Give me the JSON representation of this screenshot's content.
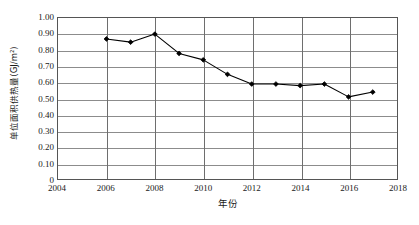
{
  "chart_data": {
    "type": "line",
    "title": "",
    "xlabel": "年份",
    "ylabel": "单位面积供热量(GJ/m²)",
    "xlim": [
      2004,
      2018
    ],
    "ylim": [
      0,
      1.0
    ],
    "grid": true,
    "legend": false,
    "x_ticks": [
      "2004",
      "2006",
      "2008",
      "2010",
      "2012",
      "2014",
      "2016",
      "2018"
    ],
    "x_tick_values": [
      2004,
      2006,
      2008,
      2010,
      2012,
      2014,
      2016,
      2018
    ],
    "y_ticks": [
      "0",
      "0.10",
      "0.20",
      "0.30",
      "0.40",
      "0.50",
      "0.60",
      "0.70",
      "0.80",
      "0.90",
      "1.00"
    ],
    "y_tick_values": [
      0,
      0.1,
      0.2,
      0.3,
      0.4,
      0.5,
      0.6,
      0.7,
      0.8,
      0.9,
      1.0
    ],
    "marker": "filled-diamond",
    "line_color": "#000000",
    "marker_color": "#000000",
    "x": [
      2006,
      2007,
      2008,
      2009,
      2010,
      2011,
      2012,
      2013,
      2014,
      2015,
      2016,
      2017
    ],
    "values": [
      0.87,
      0.85,
      0.9,
      0.78,
      0.74,
      0.65,
      0.59,
      0.59,
      0.58,
      0.59,
      0.51,
      0.54
    ],
    "series": [
      {
        "name": "单位面积供热量",
        "x": [
          2006,
          2007,
          2008,
          2009,
          2010,
          2011,
          2012,
          2013,
          2014,
          2015,
          2016,
          2017
        ],
        "values": [
          0.87,
          0.85,
          0.9,
          0.78,
          0.74,
          0.65,
          0.59,
          0.59,
          0.58,
          0.59,
          0.51,
          0.54
        ]
      }
    ]
  }
}
